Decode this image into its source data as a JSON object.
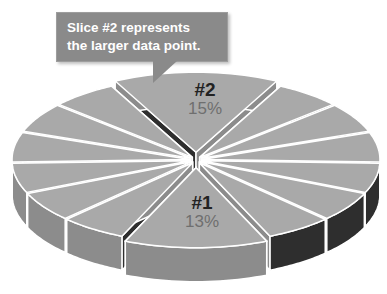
{
  "chart_data": {
    "type": "pie",
    "style": "3d-exploded",
    "title": "",
    "slices": [
      {
        "label": "#2",
        "value": 15,
        "display": "15%"
      },
      {
        "label": "",
        "value": 6
      },
      {
        "label": "",
        "value": 6
      },
      {
        "label": "",
        "value": 6
      },
      {
        "label": "",
        "value": 6
      },
      {
        "label": "",
        "value": 6
      },
      {
        "label": "",
        "value": 6
      },
      {
        "label": "#1",
        "value": 13,
        "display": "13%"
      },
      {
        "label": "",
        "value": 6
      },
      {
        "label": "",
        "value": 6
      },
      {
        "label": "",
        "value": 6
      },
      {
        "label": "",
        "value": 6
      },
      {
        "label": "",
        "value": 6
      },
      {
        "label": "",
        "value": 6
      }
    ],
    "annotations": [
      {
        "text": "Slice #2 represents the larger data point.",
        "target": "#2"
      }
    ],
    "legend": "none",
    "grid": false
  },
  "callout": {
    "line1": "Slice #2 represents",
    "line2": "the larger data point."
  },
  "labels": {
    "slice2_id": "#2",
    "slice2_pct": "15%",
    "slice1_id": "#1",
    "slice1_pct": "13%"
  },
  "colors": {
    "top_face": "#a9a9a9",
    "side_light": "#8c8c8c",
    "side_dark": "#2e2e2e",
    "outline": "#ffffff",
    "callout_bg": "#8a8a8a"
  }
}
